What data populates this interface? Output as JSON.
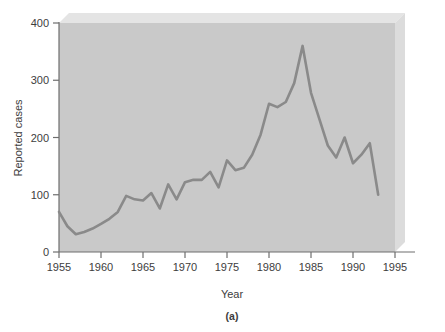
{
  "figure": {
    "caption": "(a)",
    "plot_bg_color": "#c9c9c9",
    "bevel_color": "#e4e4e4",
    "line_color": "#8a8a8a",
    "axis_color": "#6e6e6e",
    "page_bg_color": "#ffffff"
  },
  "chart_data": {
    "type": "line",
    "title": "",
    "xlabel": "Year",
    "ylabel": "Reported cases",
    "xlim": [
      1955,
      1995
    ],
    "ylim": [
      0,
      400
    ],
    "xticks": [
      1955,
      1960,
      1965,
      1970,
      1975,
      1980,
      1985,
      1990,
      1995
    ],
    "xtick_labels": [
      "1955",
      "1960",
      "1965",
      "1970",
      "1975",
      "1980",
      "1985",
      "1990",
      "1995"
    ],
    "yticks": [
      0,
      100,
      200,
      300,
      400
    ],
    "ytick_labels": [
      "0",
      "100",
      "200",
      "300",
      "400"
    ],
    "grid": false,
    "legend": null,
    "series": [
      {
        "name": "Reported cases",
        "color": "#8a8a8a",
        "x": [
          1955,
          1956,
          1957,
          1958,
          1959,
          1960,
          1961,
          1962,
          1963,
          1964,
          1965,
          1966,
          1967,
          1968,
          1969,
          1970,
          1971,
          1972,
          1973,
          1974,
          1975,
          1976,
          1977,
          1978,
          1979,
          1980,
          1981,
          1982,
          1983,
          1984,
          1985,
          1986,
          1987,
          1988,
          1989,
          1990,
          1991,
          1992,
          1993
        ],
        "y": [
          70,
          45,
          31,
          35,
          41,
          49,
          58,
          70,
          98,
          92,
          90,
          103,
          76,
          118,
          92,
          122,
          126,
          126,
          140,
          113,
          160,
          143,
          147,
          170,
          205,
          259,
          253,
          262,
          295,
          360,
          278,
          232,
          186,
          165,
          200,
          155,
          170,
          190,
          100
        ]
      }
    ]
  }
}
